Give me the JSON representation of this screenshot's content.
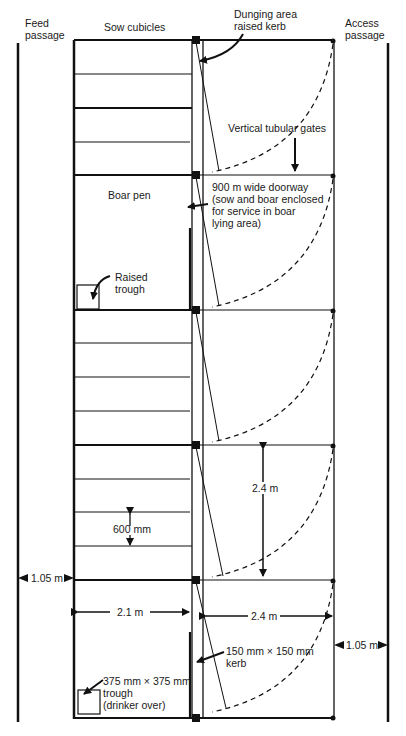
{
  "labels": {
    "feed_passage": "Feed\npassage",
    "sow_cubicles": "Sow cubicles",
    "dunging_area": "Dunging area\nraised kerb",
    "access_passage": "Access\npassage",
    "vertical_gates": "Vertical tubular gates",
    "doorway": "900 m wide doorway\n(sow and boar enclosed\nfor service in boar\nlying area)",
    "boar_pen": "Boar pen",
    "raised_trough": "Raised\ntrough",
    "dim_2_4_vertical": "2.4 m",
    "dim_600": "600 mm",
    "dim_1_05_left": "1.05 m",
    "dim_2_1": "2.1 m",
    "dim_2_4_horizontal": "2.4 m",
    "dim_1_05_right": "1.05 m",
    "kerb": "150 mm × 150 mm\nkerb",
    "trough": "375 mm × 375 mm\ntrough\n(drinker over)"
  },
  "colors": {
    "line": "#111111",
    "background": "#ffffff"
  }
}
